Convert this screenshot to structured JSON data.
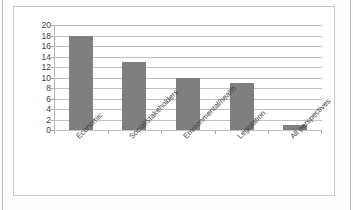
{
  "chart_data": {
    "type": "bar",
    "title": "",
    "subtitle": "",
    "xlabel": "",
    "ylabel": "",
    "categories": [
      "Economic",
      "Social/stakeholders",
      "Environmental/health",
      "Legislation",
      "All perspectives"
    ],
    "values": [
      18,
      13,
      10,
      9,
      1
    ],
    "ylim": [
      0,
      20
    ],
    "ytick_labels": [
      "0",
      "2",
      "4",
      "6",
      "8",
      "10",
      "12",
      "14",
      "16",
      "18",
      "20"
    ],
    "ytick_values": [
      0,
      2,
      4,
      6,
      8,
      10,
      12,
      14,
      16,
      18,
      20
    ],
    "grid": true,
    "grid_axis": "y",
    "legend": false,
    "legend_position": "none",
    "bar_color": "#7f7f7f",
    "gridline_color": "#c0c0c0",
    "axis_color": "#a8a8a8",
    "plot_background": "#ffffff",
    "xtick_label_rotation": -45,
    "series": [
      {
        "name": "Count",
        "values": [
          18,
          13,
          10,
          9,
          1
        ]
      }
    ]
  },
  "frame": {
    "border_color": "#c9c9c9",
    "page_edge_color": "#b9b9b9",
    "background": "#ffffff"
  }
}
